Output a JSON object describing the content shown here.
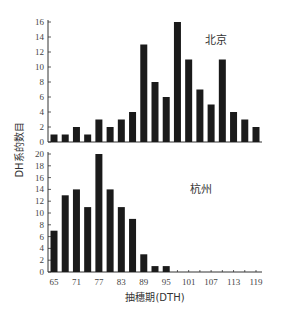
{
  "chart_data": [
    {
      "type": "bar",
      "title": "北京",
      "xlabel": "抽穗期(DTH)",
      "ylabel": "DH系的数目",
      "categories": [
        65,
        68,
        71,
        74,
        77,
        80,
        83,
        86,
        89,
        92,
        95,
        98,
        101,
        104,
        107,
        110,
        113,
        116,
        119
      ],
      "values": [
        1,
        1,
        2,
        1,
        3,
        2,
        3,
        4,
        13,
        8,
        6,
        16,
        11,
        7,
        5,
        11,
        4,
        3,
        2
      ],
      "ylim": [
        0,
        16
      ],
      "yticks": [
        0,
        2,
        4,
        6,
        8,
        10,
        12,
        14,
        16
      ],
      "grid": false
    },
    {
      "type": "bar",
      "title": "杭州",
      "xlabel": "抽穗期(DTH)",
      "ylabel": "DH系的数目",
      "categories": [
        65,
        68,
        71,
        74,
        77,
        80,
        83,
        86,
        89,
        92,
        95,
        98,
        101,
        104,
        107,
        110,
        113,
        116,
        119
      ],
      "values": [
        7,
        13,
        14,
        11,
        20,
        14,
        11,
        9,
        3,
        1,
        1,
        0,
        0,
        0,
        0,
        0,
        0,
        0,
        0
      ],
      "ylim": [
        0,
        20
      ],
      "yticks": [
        0,
        2,
        4,
        6,
        8,
        10,
        12,
        14,
        16,
        18,
        20
      ],
      "grid": false
    }
  ],
  "shared": {
    "xticks": [
      "65",
      "71",
      "77",
      "83",
      "89",
      "95",
      "101",
      "107",
      "113",
      "119"
    ],
    "xlabel": "抽穗期(DTH)",
    "ylabel": "DH系的数目",
    "top_panel_label": "北京",
    "bottom_panel_label": "杭州"
  }
}
